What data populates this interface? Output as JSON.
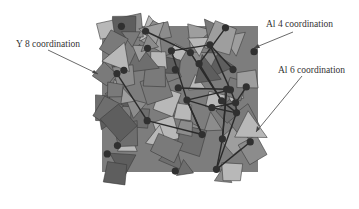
{
  "figure": {
    "type": "crystal-structure-polyhedral-model",
    "annotations": [
      {
        "id": "y8",
        "text": "Y 8 coordination"
      },
      {
        "id": "al4",
        "text": "Al 4 coordination"
      },
      {
        "id": "al6",
        "text": "Al 6 coordination"
      }
    ],
    "colors": {
      "polyhedron_dark": "#6e6e6e",
      "polyhedron_mid": "#8c8c8c",
      "polyhedron_light": "#b8b8b8",
      "bond": "#2a2a2a",
      "atom": "#303030",
      "arrow": "#444444"
    }
  }
}
